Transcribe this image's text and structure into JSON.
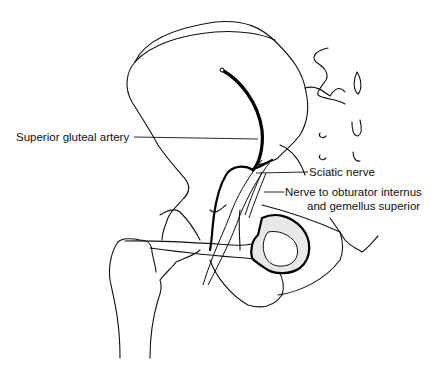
{
  "figure": {
    "labels": [
      {
        "id": "superior-gluteal-artery",
        "text": "Superior gluteal artery"
      },
      {
        "id": "sciatic-nerve",
        "text": "Sciatic nerve"
      },
      {
        "id": "nerve-to-obturator-internus-line1",
        "text": "Nerve to obturator internus"
      },
      {
        "id": "nerve-to-obturator-internus-line2",
        "text": "and gemellus superior"
      }
    ],
    "colors": {
      "line": "#111111",
      "background": "#ffffff"
    }
  }
}
